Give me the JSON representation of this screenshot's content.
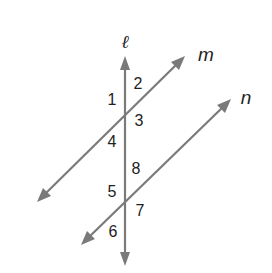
{
  "diagram": {
    "lines": {
      "transversal": {
        "label": "ℓ",
        "color": "#7a7a7a"
      },
      "parallel_top": {
        "label": "m",
        "color": "#7a7a7a"
      },
      "parallel_bottom": {
        "label": "n",
        "color": "#7a7a7a"
      }
    },
    "angles": {
      "a1": "1",
      "a2": "2",
      "a3": "3",
      "a4": "4",
      "a5": "5",
      "a6": "6",
      "a7": "7",
      "a8": "8"
    },
    "label_color": "#222222",
    "background": "#ffffff"
  }
}
